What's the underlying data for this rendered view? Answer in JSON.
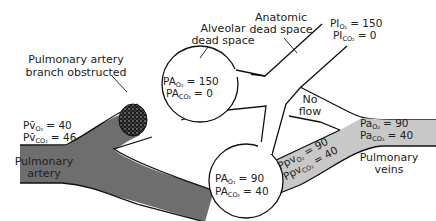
{
  "diagram": {
    "colors": {
      "mixed_venous_blood": "#6e6e6e",
      "arterialized_blood": "#c8c8c8",
      "airway": "#ffffff",
      "outline": "#111111",
      "clot": "#2a2a2a"
    },
    "labels": {
      "pulmonary_artery_obstructed_line1": "Pulmonary artery",
      "pulmonary_artery_obstructed_line2": "branch obstructed",
      "alveolar_dead_space_line1": "Alveolar",
      "alveolar_dead_space_line2": "dead space",
      "anatomic_dead_space_line1": "Anatomic",
      "anatomic_dead_space_line2": "dead space",
      "no_flow_line1": "No",
      "no_flow_line2": "flow",
      "pulmonary_artery_line1": "Pulmonary",
      "pulmonary_artery_line2": "artery",
      "pulmonary_veins_line1": "Pulmonary",
      "pulmonary_veins_line2": "veins"
    },
    "values": {
      "inspired": {
        "o2_prefix": "PI",
        "o2_sub": "O₂",
        "o2_value": "= 150",
        "co2_prefix": "PI",
        "co2_sub": "CO₂",
        "co2_value": "= 0"
      },
      "dead_space_alveolus": {
        "o2_prefix": "PA",
        "o2_sub": "O₂",
        "o2_value": "= 150",
        "co2_prefix": "PA",
        "co2_sub": "CO₂",
        "co2_value": "= 0"
      },
      "perfused_alveolus": {
        "o2_prefix": "PA",
        "o2_sub": "O₂",
        "o2_value": "= 90",
        "co2_prefix": "PA",
        "co2_sub": "CO₂",
        "co2_value": "= 40"
      },
      "mixed_venous": {
        "o2_prefix": "Pv̄",
        "o2_sub": "O₂",
        "o2_value": "= 40",
        "co2_prefix": "Pv̄",
        "co2_sub": "CO₂",
        "co2_value": "= 46"
      },
      "pulmonary_venous": {
        "o2_prefix": "Ppv",
        "o2_sub": "O₂",
        "o2_value": "= 90",
        "co2_prefix": "Ppv",
        "co2_sub": "CO₂",
        "co2_value": "= 40"
      },
      "arterial": {
        "o2_prefix": "Pa",
        "o2_sub": "O₂",
        "o2_value": "= 90",
        "co2_prefix": "Pa",
        "co2_sub": "CO₂",
        "co2_value": "= 40"
      }
    }
  }
}
